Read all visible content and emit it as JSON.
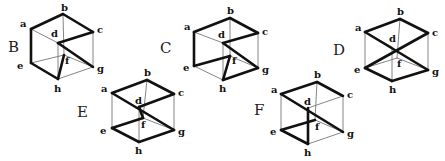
{
  "diagram": {
    "title": "",
    "colors": {
      "thick": "#111111",
      "thin": "#777777",
      "text": "#111111",
      "background": "#ffffff"
    },
    "cubes": [
      {
        "name": "B",
        "label_pos": [
          8,
          52
        ],
        "vertices": {
          "a": [
            31,
            29
          ],
          "b": [
            63,
            14
          ],
          "c": [
            93,
            32
          ],
          "d": [
            58,
            43
          ],
          "e": [
            31,
            63
          ],
          "f": [
            64,
            55
          ],
          "g": [
            93,
            67
          ],
          "h": [
            58,
            79
          ]
        },
        "vertex_labels": {
          "a": [
            20,
            27
          ],
          "b": [
            61,
            11
          ],
          "c": [
            97,
            33
          ],
          "d": [
            51,
            37
          ],
          "e": [
            17,
            69
          ],
          "f": [
            65,
            64
          ],
          "g": [
            97,
            72
          ],
          "h": [
            54,
            92
          ]
        },
        "thin_edges": [
          [
            "a",
            "d"
          ],
          [
            "b",
            "f"
          ],
          [
            "c",
            "g"
          ],
          [
            "d",
            "h"
          ],
          [
            "e",
            "f"
          ],
          [
            "f",
            "g"
          ],
          [
            "h",
            "g"
          ]
        ],
        "thick_edges": [
          [
            "a",
            "b"
          ],
          [
            "b",
            "c"
          ],
          [
            "a",
            "e"
          ],
          [
            "e",
            "h"
          ],
          [
            "c",
            "d"
          ],
          [
            "d",
            "g"
          ],
          [
            "h",
            "f"
          ]
        ]
      },
      {
        "name": "C",
        "label_pos": [
          160,
          53
        ],
        "vertices": {
          "a": [
            194,
            32
          ],
          "b": [
            230,
            18
          ],
          "c": [
            258,
            33
          ],
          "d": [
            223,
            43
          ],
          "e": [
            194,
            66
          ],
          "f": [
            230,
            56
          ],
          "g": [
            258,
            68
          ],
          "h": [
            223,
            80
          ]
        },
        "vertex_labels": {
          "a": [
            184,
            30
          ],
          "b": [
            227,
            14
          ],
          "c": [
            262,
            35
          ],
          "d": [
            218,
            38
          ],
          "e": [
            183,
            71
          ],
          "f": [
            232,
            64
          ],
          "g": [
            262,
            73
          ],
          "h": [
            219,
            92
          ]
        },
        "thin_edges": [
          [
            "a",
            "d"
          ],
          [
            "b",
            "f"
          ],
          [
            "c",
            "g"
          ],
          [
            "d",
            "h"
          ],
          [
            "e",
            "h"
          ],
          [
            "f",
            "g"
          ]
        ],
        "thick_edges": [
          [
            "a",
            "b"
          ],
          [
            "b",
            "c"
          ],
          [
            "a",
            "e"
          ],
          [
            "c",
            "d"
          ],
          [
            "d",
            "g"
          ],
          [
            "e",
            "f"
          ],
          [
            "f",
            "h"
          ],
          [
            "h",
            "g"
          ]
        ]
      },
      {
        "name": "D",
        "label_pos": [
          333,
          55
        ],
        "vertices": {
          "a": [
            365,
            32
          ],
          "b": [
            400,
            19
          ],
          "c": [
            428,
            33
          ],
          "d": [
            392,
            47
          ],
          "e": [
            365,
            68
          ],
          "f": [
            397,
            58
          ],
          "g": [
            428,
            70
          ],
          "h": [
            392,
            81
          ]
        },
        "vertex_labels": {
          "a": [
            355,
            31
          ],
          "b": [
            397,
            15
          ],
          "c": [
            432,
            36
          ],
          "d": [
            389,
            42
          ],
          "e": [
            354,
            73
          ],
          "f": [
            397,
            67
          ],
          "g": [
            432,
            75
          ],
          "h": [
            389,
            93
          ]
        },
        "thin_edges": [
          [
            "a",
            "e"
          ],
          [
            "c",
            "g"
          ],
          [
            "b",
            "f"
          ],
          [
            "d",
            "h"
          ],
          [
            "e",
            "f"
          ],
          [
            "f",
            "g"
          ],
          [
            "a",
            "d"
          ]
        ],
        "thick_edges": [
          [
            "a",
            "b"
          ],
          [
            "b",
            "c"
          ],
          [
            "a",
            "g"
          ],
          [
            "c",
            "e"
          ],
          [
            "e",
            "h"
          ],
          [
            "h",
            "g"
          ]
        ]
      },
      {
        "name": "E",
        "label_pos": [
          77,
          117
        ],
        "vertices": {
          "a": [
            112,
            93
          ],
          "b": [
            147,
            80
          ],
          "c": [
            174,
            94
          ],
          "d": [
            139,
            107
          ],
          "e": [
            112,
            128
          ],
          "f": [
            143,
            118
          ],
          "g": [
            174,
            130
          ],
          "h": [
            139,
            142
          ]
        },
        "vertex_labels": {
          "a": [
            101,
            92
          ],
          "b": [
            144,
            76
          ],
          "c": [
            178,
            96
          ],
          "d": [
            135,
            104
          ],
          "e": [
            100,
            134
          ],
          "f": [
            141,
            128
          ],
          "g": [
            178,
            135
          ],
          "h": [
            135,
            154
          ]
        },
        "thin_edges": [
          [
            "a",
            "e"
          ],
          [
            "c",
            "g"
          ],
          [
            "b",
            "f"
          ],
          [
            "d",
            "h"
          ],
          [
            "f",
            "g"
          ]
        ],
        "thick_edges": [
          [
            "a",
            "b"
          ],
          [
            "b",
            "c"
          ],
          [
            "a",
            "g"
          ],
          [
            "c",
            "d"
          ],
          [
            "d",
            "f"
          ],
          [
            "e",
            "f"
          ],
          [
            "e",
            "h"
          ],
          [
            "h",
            "g"
          ]
        ]
      },
      {
        "name": "F",
        "label_pos": [
          254,
          115
        ],
        "vertices": {
          "a": [
            281,
            94
          ],
          "b": [
            317,
            82
          ],
          "c": [
            343,
            96
          ],
          "d": [
            308,
            108
          ],
          "e": [
            281,
            130
          ],
          "f": [
            315,
            120
          ],
          "g": [
            343,
            132
          ],
          "h": [
            308,
            144
          ]
        },
        "vertex_labels": {
          "a": [
            271,
            93
          ],
          "b": [
            314,
            78
          ],
          "c": [
            347,
            98
          ],
          "d": [
            304,
            105
          ],
          "e": [
            270,
            135
          ],
          "f": [
            315,
            130
          ],
          "g": [
            347,
            137
          ],
          "h": [
            304,
            156
          ]
        },
        "thin_edges": [
          [
            "a",
            "e"
          ],
          [
            "c",
            "g"
          ],
          [
            "b",
            "f"
          ],
          [
            "h",
            "g"
          ],
          [
            "d",
            "c"
          ],
          [
            "f",
            "g"
          ]
        ],
        "thick_edges": [
          [
            "a",
            "b"
          ],
          [
            "b",
            "c"
          ],
          [
            "a",
            "g"
          ],
          [
            "d",
            "h"
          ],
          [
            "e",
            "h"
          ],
          [
            "e",
            "f"
          ]
        ]
      }
    ]
  }
}
